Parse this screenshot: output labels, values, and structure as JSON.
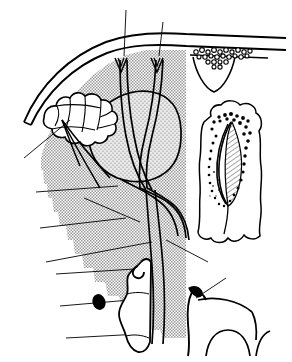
{
  "figure": {
    "title": "Anatomical line drawing of lacrimal gland region with histological insets",
    "domain": "anatomical-illustration",
    "width": 292,
    "height": 362,
    "background_color": "#ffffff",
    "ink_color": "#000000",
    "stipple_fill_color": "#b4b4b4",
    "gland_stipple_color": "#8c8c8c",
    "caption": ""
  },
  "structures": {
    "outer_contour_label": "orbital rim / skin surface arc",
    "shaded_field_label": "orbital soft tissue field (halftone shading)",
    "stippled_sphere_label": "lacrimal gland body (stippled)",
    "lobulated_mass_label": "accessory lobulated gland",
    "duct_bundle_label": "excretory duct bundle",
    "top_cell_cluster_label": "epithelial cell cluster with crypt",
    "right_inset_label": "follicle / crypt histological inset with hatched lumen",
    "lower_left_inset_label": "bone / cartilage fragment outline",
    "lower_right_inset_label": "adjacent bony process outline",
    "black_oval_label": "solid ovoid marker"
  },
  "annotations": {
    "leader_lines": [
      {
        "id": "leader-top-left",
        "name": "duct-leader-upper-left"
      },
      {
        "id": "leader-top-right",
        "name": "duct-leader-upper-right"
      },
      {
        "id": "leader-mid-1",
        "name": "gland-leader-1"
      },
      {
        "id": "leader-mid-2",
        "name": "gland-leader-2"
      },
      {
        "id": "leader-mid-3",
        "name": "gland-leader-3"
      },
      {
        "id": "leader-lower-1",
        "name": "inset-leader-lower-left"
      },
      {
        "id": "leader-lower-2",
        "name": "inset-leader-lower-right"
      },
      {
        "id": "leader-crypt",
        "name": "crypt-leader"
      }
    ],
    "labels": []
  },
  "legend": {
    "entries": []
  }
}
